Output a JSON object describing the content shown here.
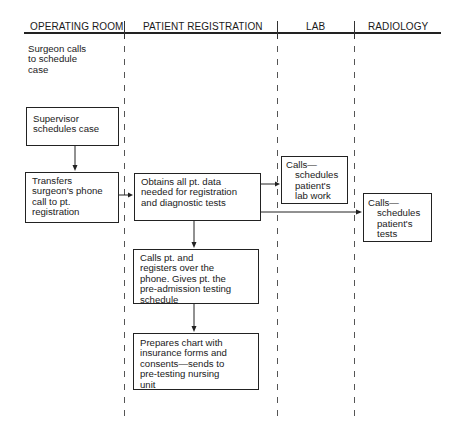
{
  "lanes": [
    {
      "label": "OPERATING ROOM"
    },
    {
      "label": "PATIENT REGISTRATION"
    },
    {
      "label": "LAB"
    },
    {
      "label": "RADIOLOGY"
    }
  ],
  "operating_room": {
    "start_text": [
      "Surgeon calls",
      "to schedule",
      "case"
    ],
    "supervisor_box": [
      "Supervisor",
      "schedules case"
    ],
    "transfer_box": [
      "Transfers",
      "surgeon's phone",
      "call to pt.",
      "registration"
    ]
  },
  "patient_registration": {
    "obtain_box": [
      "Obtains all pt. data",
      "needed for registration",
      "and diagnostic tests"
    ],
    "calls_box": [
      "Calls pt. and",
      "registers over the",
      "phone. Gives pt. the",
      "pre-admission testing",
      "schedule"
    ],
    "prepares_box": [
      "Prepares chart with",
      "insurance forms and",
      "consents—sends to",
      "pre-testing nursing",
      "unit"
    ]
  },
  "lab": {
    "box": [
      "Calls—",
      "schedules",
      "patient's",
      "lab work"
    ]
  },
  "radiology": {
    "box": [
      "Calls—",
      "schedules",
      "patient's",
      "tests"
    ]
  }
}
